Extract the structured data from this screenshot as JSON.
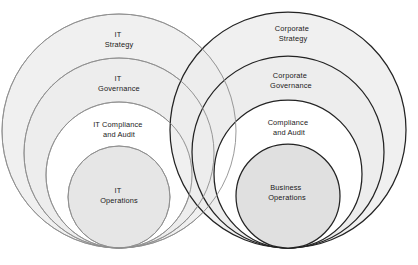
{
  "diagram": {
    "type": "nested-venn-circles",
    "title": "",
    "canvas": {
      "width": 418,
      "height": 265,
      "background": "#ffffff"
    },
    "colors": {
      "fill_shaded": "#ececec",
      "fill_plain": "#ffffff",
      "stroke_light": "#9a9a9a",
      "stroke_dark": "#222222",
      "label_text": "#1a1a1a"
    },
    "groups": [
      {
        "id": "it-group",
        "name": "IT",
        "stroke": "#9a9a9a",
        "center_x": 119,
        "bottom_y": 248,
        "rings": [
          {
            "id": "it-strategy",
            "label_line1": "IT",
            "label_line2": "Strategy",
            "radius": 117,
            "fill": "#ececec",
            "label_x": 119,
            "label_y": 40
          },
          {
            "id": "it-governance",
            "label_line1": "IT",
            "label_line2": "Governance",
            "radius": 95,
            "fill": "#ececec",
            "label_x": 119,
            "label_y": 84
          },
          {
            "id": "it-compliance-and-audit",
            "label_line1": "IT Compliance",
            "label_line2": "and Audit",
            "radius": 73,
            "fill": "#ffffff",
            "label_x": 119,
            "label_y": 130
          },
          {
            "id": "it-operations",
            "label_line1": "IT",
            "label_line2": "Operations",
            "radius": 51,
            "fill": "#ececec",
            "label_x": 119,
            "label_y": 196
          }
        ]
      },
      {
        "id": "corporate-group",
        "name": "Corporate",
        "stroke": "#222222",
        "center_x": 288,
        "bottom_y": 248,
        "rings": [
          {
            "id": "corporate-strategy",
            "label_line1": "Corporate",
            "label_line2": "Strategy",
            "radius": 118,
            "fill": "#ececec",
            "label_x": 293,
            "label_y": 34
          },
          {
            "id": "corporate-governance",
            "label_line1": "Corporate",
            "label_line2": "Governance",
            "radius": 96,
            "fill": "#ececec",
            "label_x": 291,
            "label_y": 81
          },
          {
            "id": "compliance-and-audit",
            "label_line1": "Compliance",
            "label_line2": "and Audit",
            "radius": 74,
            "fill": "#ffffff",
            "label_x": 289,
            "label_y": 128
          },
          {
            "id": "business-operations",
            "label_line1": "Business",
            "label_line2": "Operations",
            "radius": 52,
            "fill": "#ececec",
            "label_x": 287,
            "label_y": 193
          }
        ]
      }
    ]
  }
}
